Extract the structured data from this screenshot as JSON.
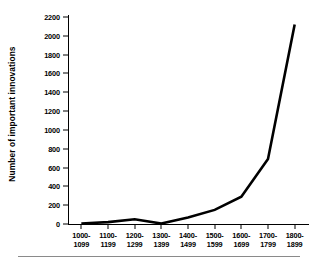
{
  "chart_data": {
    "type": "line",
    "title": "",
    "xlabel": "",
    "ylabel": "Number of important innovations",
    "categories": [
      "1000-\n1099",
      "1100-\n1199",
      "1200-\n1299",
      "1300-\n1399",
      "1400-\n1499",
      "1500-\n1599",
      "1600-\n1699",
      "1700-\n1799",
      "1800-\n1899"
    ],
    "category_lines": [
      [
        "1000-",
        "1099"
      ],
      [
        "1100-",
        "1199"
      ],
      [
        "1200-",
        "1299"
      ],
      [
        "1300-",
        "1399"
      ],
      [
        "1400-",
        "1499"
      ],
      [
        "1500-",
        "1599"
      ],
      [
        "1600-",
        "1699"
      ],
      [
        "1700-",
        "1799"
      ],
      [
        "1800-",
        "1899"
      ]
    ],
    "values": [
      5,
      20,
      50,
      5,
      70,
      150,
      290,
      690,
      2120
    ],
    "ylim": [
      0,
      2200
    ],
    "ytick_values": [
      0,
      200,
      400,
      600,
      800,
      1000,
      1200,
      1400,
      1600,
      1800,
      2000,
      2200
    ],
    "ytick_labels": [
      "0",
      "200",
      "400",
      "600",
      "800",
      "1000",
      "1200",
      "1400",
      "1600",
      "1800",
      "2000",
      "2200"
    ],
    "grid": false,
    "legend": false,
    "line_color": "#000000",
    "line_width": 2.6,
    "background_color": "#ffffff"
  }
}
